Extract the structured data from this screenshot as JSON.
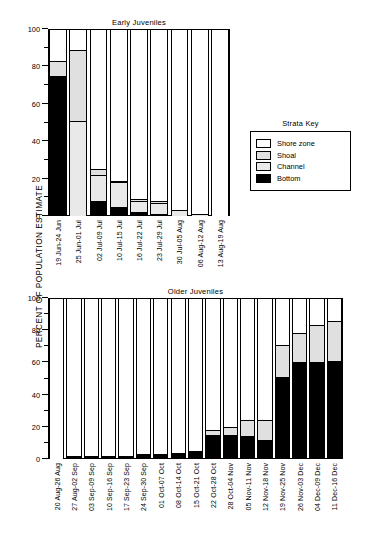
{
  "axis": {
    "ylabel": "PERCENT OF POPULATION ESTIMATE",
    "yticks": [
      "0",
      "20",
      "40",
      "60",
      "80",
      "100"
    ]
  },
  "legend": {
    "title": "Strata Key",
    "items": [
      {
        "label": "Shore zone",
        "key": "shore",
        "color": "#ffffff"
      },
      {
        "label": "Shoal",
        "key": "shoal",
        "color": "#e0e0e0"
      },
      {
        "label": "Channel",
        "key": "channel",
        "color": "#e9e9e9"
      },
      {
        "label": "Bottom",
        "key": "bottom",
        "color": "#000000"
      }
    ]
  },
  "chart_data": [
    {
      "type": "bar",
      "title": "Early Juveniles",
      "xlabel": "",
      "ylabel": "PERCENT OF POPULATION ESTIMATE",
      "ylim": [
        0,
        100
      ],
      "yticks": [
        0,
        20,
        40,
        60,
        80,
        100
      ],
      "stacked": true,
      "grid": false,
      "legend_position": "right",
      "categories": [
        "19 Jun-24 Jun",
        "25 Jun-01 Jul",
        "02 Jul-09 Jul",
        "10 Jul-15 Jul",
        "16 Jul-22 Jul",
        "23 Jul-29 Jul",
        "30 Jul-05 Aug",
        "06 Aug-12 Aug",
        "13 Aug-19 Aug"
      ],
      "series": [
        {
          "name": "Bottom",
          "values": [
            75,
            0,
            8,
            5,
            2,
            1,
            0,
            0,
            0
          ]
        },
        {
          "name": "Channel",
          "values": [
            0,
            51,
            14,
            13,
            6,
            6,
            3,
            1,
            0
          ]
        },
        {
          "name": "Shoal",
          "values": [
            8,
            38,
            3,
            1,
            1,
            1,
            0,
            0,
            0
          ]
        },
        {
          "name": "Shore zone",
          "values": [
            17,
            11,
            75,
            81,
            91,
            92,
            97,
            99,
            100
          ]
        }
      ]
    },
    {
      "type": "bar",
      "title": "Older Juveniles",
      "xlabel": "",
      "ylabel": "PERCENT OF POPULATION ESTIMATE",
      "ylim": [
        0,
        100
      ],
      "yticks": [
        0,
        20,
        40,
        60,
        80,
        100
      ],
      "stacked": true,
      "grid": false,
      "legend_position": "none",
      "categories": [
        "20 Aug-26 Aug",
        "27 Aug-02 Sep",
        "03 Sep-09 Sep",
        "10 Sep-16 Sep",
        "17 Sep-23 Sep",
        "24 Sep-30 Sep",
        "01 Oct-07 Oct",
        "08 Oct-14 Oct",
        "15 Oct-21 Oct",
        "22 Oct-28 Oct",
        "28 Oct-04 Nov",
        "05 Nov-11 Nov",
        "12 Nov-18 Nov",
        "19 Nov-25 Nov",
        "26 Nov-03 Dec",
        "04 Dec-09 Dec",
        "11 Dec-16 Dec"
      ],
      "series": [
        {
          "name": "Bottom",
          "values": [
            0,
            2,
            2,
            2,
            2,
            3,
            3,
            4,
            5,
            15,
            15,
            14,
            12,
            51,
            60,
            60,
            61
          ]
        },
        {
          "name": "Channel",
          "values": [
            0,
            0,
            0,
            0,
            0,
            0,
            0,
            0,
            0,
            0,
            0,
            0,
            0,
            0,
            0,
            0,
            0
          ]
        },
        {
          "name": "Shoal",
          "values": [
            0,
            0,
            0,
            0,
            0,
            0,
            0,
            0,
            0,
            3,
            5,
            10,
            12,
            20,
            18,
            23,
            25
          ]
        },
        {
          "name": "Shore zone",
          "values": [
            100,
            98,
            98,
            98,
            98,
            97,
            97,
            96,
            95,
            82,
            80,
            76,
            76,
            29,
            22,
            17,
            14
          ]
        }
      ]
    }
  ]
}
